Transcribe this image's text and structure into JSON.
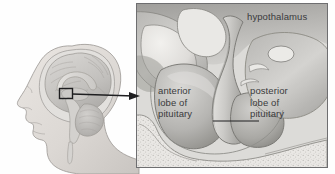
{
  "figure": {
    "background_color": "#ffffff"
  },
  "head_panel": {
    "name": "lateral head and brain profile",
    "callout_box_label": "pituitary region magnification box",
    "skin_color": "#dedad6",
    "brain_color": "#c8c6c4",
    "outline_color": "#8e8b88"
  },
  "inset_panel": {
    "name": "magnified midsagittal view of pituitary",
    "border_color": "#6e6e70",
    "fill_color": "#e8e8e6",
    "shadow_color": "#8f8f8d"
  },
  "labels": {
    "hypothalamus": "hypothalamus",
    "anterior_lobe": "anterior\nlobe of\npituitary",
    "posterior_lobe": "posterior\nlobe of\npituitary"
  },
  "connectors": {
    "callout_arrow": "arrow from head callout box to inset panel",
    "posterior_leader": "leader line from posterior lobe label to gland"
  },
  "colors": {
    "text": "#3a3a3c",
    "line": "#222224",
    "tissue_light": "#f0efec",
    "tissue_mid": "#c9c8c5",
    "tissue_dark": "#8d8c89",
    "bone_stipple": "#cfcecb"
  }
}
